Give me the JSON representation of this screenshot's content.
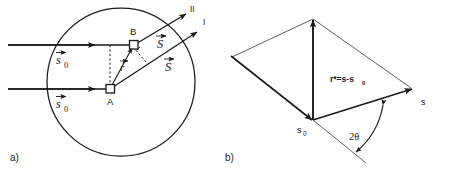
{
  "figure": {
    "background_color": "#ffffff",
    "ink_color": "#1a1a1a",
    "width": 456,
    "height": 178
  },
  "panel_a": {
    "panel_label": "a)",
    "description": "Circular scattering volume with two parallel incident rays and two scattered rays",
    "incident_vector_upper_label": "s",
    "incident_vector_upper_subscript": "0",
    "incident_vector_lower_label": "s",
    "incident_vector_lower_subscript": "0",
    "scattered_vector_upper_label": "S",
    "scattered_vector_lower_label": "S",
    "position_vector_label": "r",
    "point_a_label": "A",
    "point_b_label": "B",
    "ray_upper_label": "II",
    "ray_lower_label": "I"
  },
  "panel_b": {
    "panel_label": "b)",
    "description": "Parallelogram construction of the scattering vector",
    "incident_label": "s",
    "incident_subscript": "0",
    "scattered_label": "s",
    "scattering_vector_label": "r*=s-s",
    "scattering_vector_subscript": "0",
    "angle_label": "2θ"
  }
}
